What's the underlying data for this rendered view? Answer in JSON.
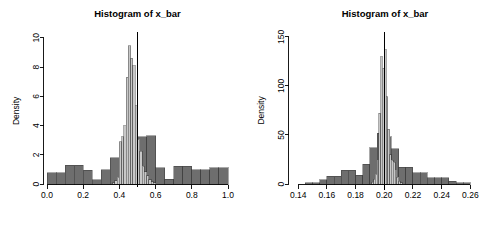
{
  "page": {
    "background_color": "#ffffff",
    "width": 494,
    "height": 225,
    "panel_count": 2
  },
  "colors": {
    "dark_gray": "#6e6e6e",
    "light_gray": "#c8c8c8",
    "border": "#2b2b2b",
    "axis": "#000000",
    "vline": "#000000"
  },
  "chart_data": [
    {
      "type": "bar",
      "id": "left-histogram",
      "title": "Histogram of x_bar",
      "xlabel": "",
      "ylabel": "Density",
      "xlim": [
        0.0,
        1.0
      ],
      "ylim": [
        0,
        10.4
      ],
      "grid": false,
      "legend": "none",
      "xticks": [
        "0.0",
        "0.2",
        "0.4",
        "0.6",
        "0.8",
        "1.0"
      ],
      "xtick_values": [
        0.0,
        0.2,
        0.4,
        0.6,
        0.8,
        1.0
      ],
      "yticks": [
        "0",
        "2",
        "4",
        "6",
        "8",
        "10"
      ],
      "ytick_values": [
        0,
        2,
        4,
        6,
        8,
        10
      ],
      "annotations": [
        {
          "name": "mean-vertical-line",
          "type": "vline",
          "x": 0.5,
          "y_top": 10.4
        }
      ],
      "series": [
        {
          "name": "population (dark gray)",
          "color": "#6e6e6e",
          "bin_width": 0.05,
          "bin_starts": [
            0.0,
            0.05,
            0.1,
            0.15,
            0.2,
            0.25,
            0.3,
            0.35,
            0.4,
            0.45,
            0.5,
            0.55,
            0.6,
            0.65,
            0.7,
            0.75,
            0.8,
            0.85,
            0.9,
            0.95
          ],
          "values": [
            0.78,
            0.78,
            1.28,
            1.28,
            0.95,
            0.3,
            0.98,
            1.8,
            2.55,
            3.12,
            3.25,
            3.3,
            1.1,
            0.32,
            1.22,
            1.22,
            0.98,
            0.98,
            1.12,
            1.12
          ]
        },
        {
          "name": "sample means (light gray)",
          "color": "#c8c8c8",
          "bin_width": 0.0125,
          "bin_starts": [
            0.3625,
            0.375,
            0.3875,
            0.4,
            0.4125,
            0.425,
            0.4375,
            0.45,
            0.4625,
            0.475,
            0.4875,
            0.5,
            0.5125,
            0.525,
            0.5375,
            0.55,
            0.5625,
            0.575,
            0.5875
          ],
          "values": [
            0.1,
            0.22,
            0.45,
            2.9,
            3.25,
            4.0,
            7.3,
            9.45,
            8.6,
            8.1,
            5.35,
            3.05,
            2.25,
            1.2,
            0.85,
            0.55,
            0.3,
            0.15,
            0.1
          ]
        }
      ]
    },
    {
      "type": "bar",
      "id": "right-histogram",
      "title": "Histogram of x_bar",
      "xlabel": "",
      "ylabel": "Density",
      "xlim": [
        0.135,
        0.266
      ],
      "ylim": [
        0,
        155
      ],
      "grid": false,
      "legend": "none",
      "xticks": [
        "0.14",
        "0.16",
        "0.18",
        "0.20",
        "0.22",
        "0.24",
        "0.26"
      ],
      "xtick_values": [
        0.14,
        0.16,
        0.18,
        0.2,
        0.22,
        0.24,
        0.26
      ],
      "yticks": [
        "0",
        "50",
        "100",
        "150"
      ],
      "ytick_values": [
        0,
        50,
        100,
        150
      ],
      "annotations": [
        {
          "name": "mean-vertical-line",
          "type": "vline",
          "x": 0.2,
          "y_top": 155
        }
      ],
      "series": [
        {
          "name": "population (dark gray)",
          "color": "#6e6e6e",
          "bin_width": 0.005,
          "bin_starts": [
            0.145,
            0.15,
            0.155,
            0.16,
            0.165,
            0.17,
            0.175,
            0.18,
            0.185,
            0.19,
            0.195,
            0.2,
            0.205,
            0.21,
            0.215,
            0.22,
            0.225,
            0.23,
            0.235,
            0.24,
            0.245,
            0.25,
            0.255
          ],
          "values": [
            1.5,
            1.5,
            4.5,
            8.0,
            8.0,
            14.0,
            14.0,
            9.0,
            20.0,
            37.0,
            52.0,
            48.0,
            36.0,
            17.0,
            17.0,
            11.5,
            11.5,
            6.5,
            6.5,
            6.5,
            3.0,
            1.5,
            1.5
          ]
        },
        {
          "name": "sample means (light gray)",
          "color": "#c8c8c8",
          "bin_width": 0.00125,
          "bin_starts": [
            0.19125,
            0.1925,
            0.19375,
            0.195,
            0.19625,
            0.1975,
            0.19875,
            0.2,
            0.20125,
            0.2025,
            0.20375,
            0.205,
            0.20625,
            0.2075,
            0.20875,
            0.21,
            0.21125
          ],
          "values": [
            2.0,
            5.0,
            10.0,
            24.0,
            72.0,
            130.0,
            118.0,
            137.0,
            89.0,
            56.0,
            30.0,
            24.0,
            22.0,
            14.0,
            7.0,
            3.0,
            1.5
          ]
        }
      ]
    }
  ]
}
